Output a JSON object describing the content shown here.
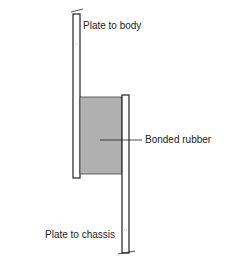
{
  "diagram": {
    "labels": {
      "top": "Plate to body",
      "middle": "Bonded rubber",
      "bottom": "Plate to chassis"
    },
    "colors": {
      "line": "#222222",
      "rubber": "#b0b0b0",
      "background": "#ffffff"
    }
  }
}
